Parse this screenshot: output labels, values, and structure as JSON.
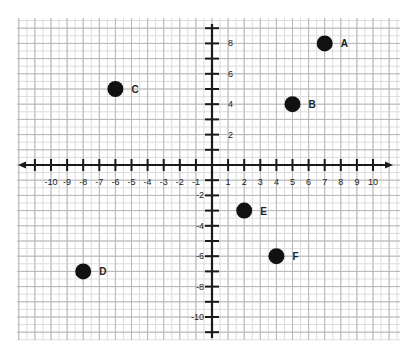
{
  "chart_data": {
    "type": "scatter",
    "title": "",
    "xlabel": "",
    "ylabel": "",
    "xlim": [
      -11,
      10
    ],
    "ylim": [
      -11,
      9
    ],
    "grid": true,
    "legend": null,
    "x_tick_labels": [
      "-10",
      "-9",
      "-8",
      "-7",
      "-6",
      "-5",
      "-4",
      "-3",
      "-2",
      "-1",
      "1",
      "2",
      "3",
      "4",
      "5",
      "6",
      "7",
      "8",
      "9",
      "10"
    ],
    "y_tick_labels": [
      "8",
      "6",
      "4",
      "2",
      "-2",
      "-4",
      "-6",
      "-8",
      "-10"
    ],
    "points": [
      {
        "label": "A",
        "x": 7,
        "y": 8
      },
      {
        "label": "B",
        "x": 5,
        "y": 4
      },
      {
        "label": "C",
        "x": -6,
        "y": 5
      },
      {
        "label": "D",
        "x": -8,
        "y": -7
      },
      {
        "label": "E",
        "x": 2,
        "y": -3
      },
      {
        "label": "F",
        "x": 4,
        "y": -6
      }
    ]
  },
  "colors": {
    "grid_major": "#b8b8b8",
    "grid_minor": "#dcdcdc",
    "axis": "#1a1a1a",
    "point": "#111111"
  }
}
